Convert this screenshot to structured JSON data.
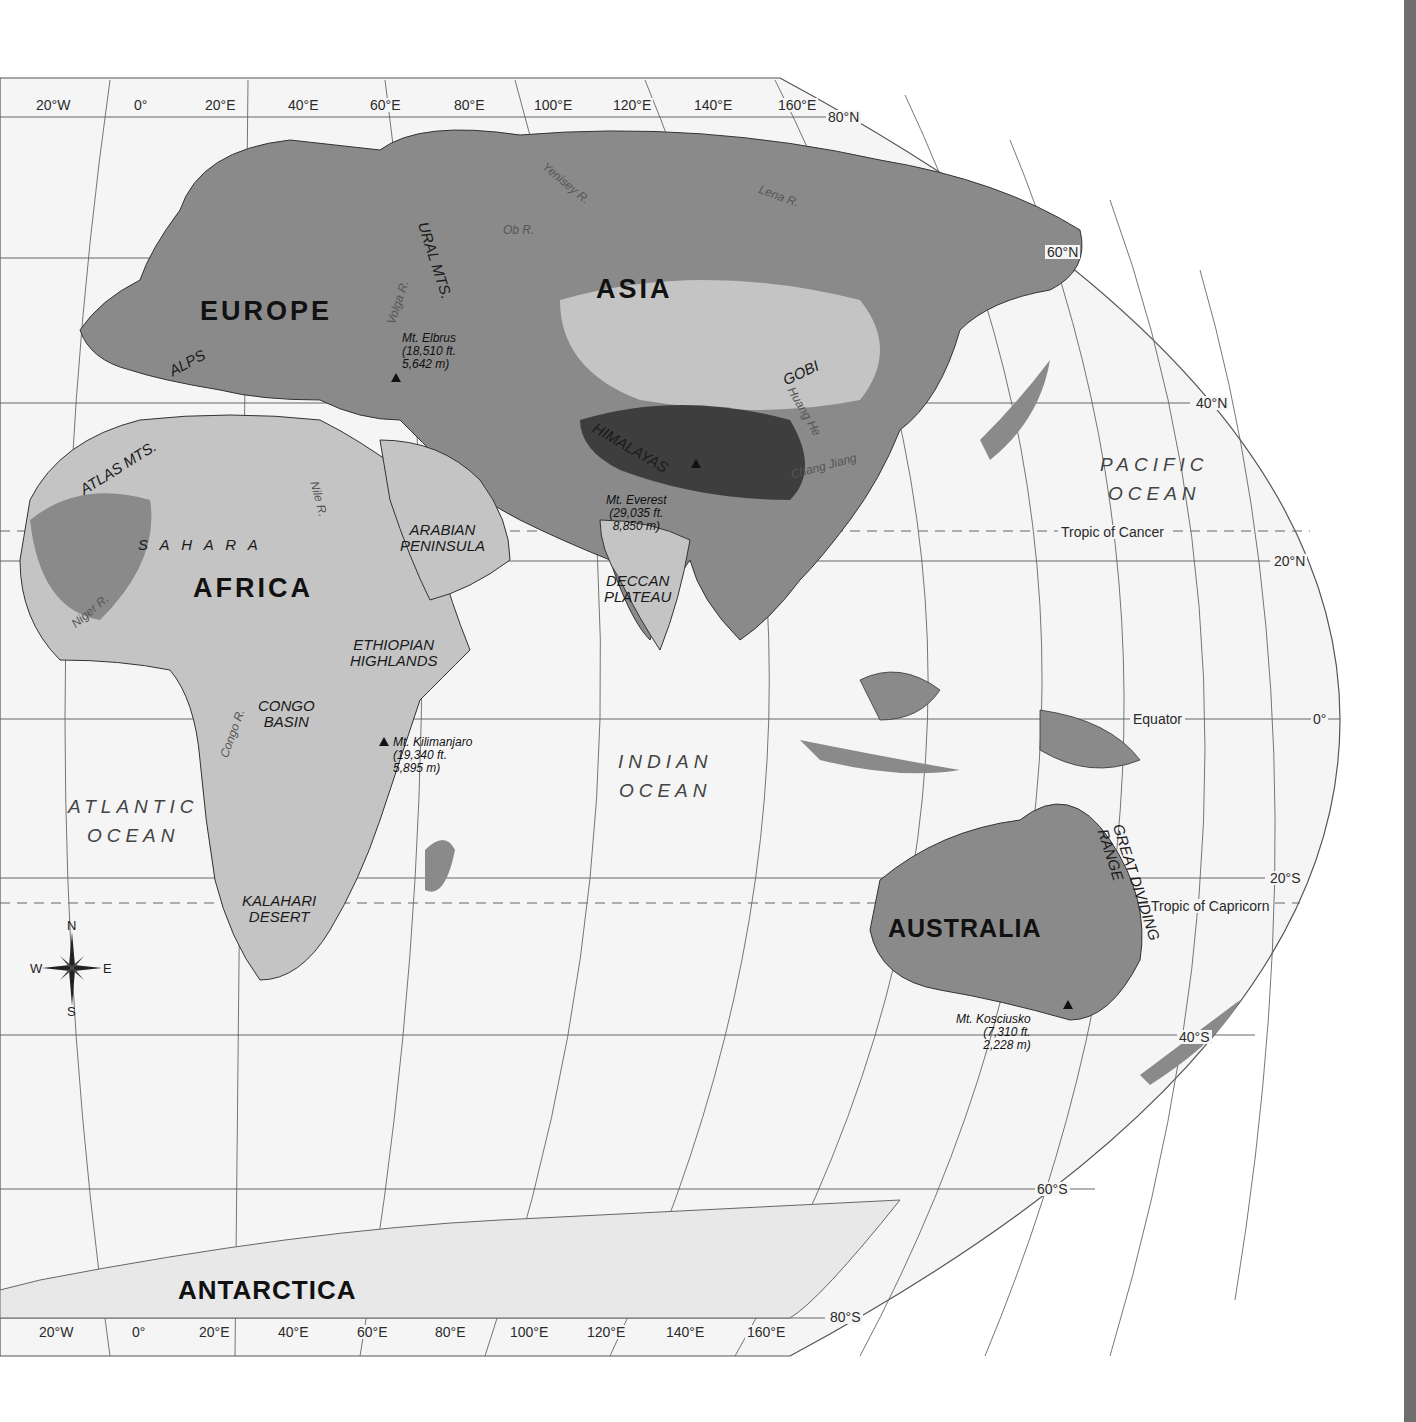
{
  "map": {
    "title": "Eastern Hemisphere Physical Map",
    "colors": {
      "ocean": "#f5f5f5",
      "land_low": "#8a8a8a",
      "land_mid": "#c4c4c4",
      "land_high": "#3e3e3e",
      "grid": "#555555",
      "border": "#111111",
      "spine": "#6e6e6e"
    },
    "longitude_labels_top": [
      "20°W",
      "0°",
      "20°E",
      "40°E",
      "60°E",
      "80°E",
      "100°E",
      "120°E",
      "140°E",
      "160°E"
    ],
    "longitude_labels_bottom": [
      "20°W",
      "0°",
      "20°E",
      "40°E",
      "60°E",
      "80°E",
      "100°E",
      "120°E",
      "140°E",
      "160°E"
    ],
    "latitude_labels": [
      "80°N",
      "60°N",
      "40°N",
      "20°N",
      "0°",
      "20°S",
      "40°S",
      "60°S",
      "80°S"
    ],
    "special_lines": {
      "tropic_cancer": "Tropic of Cancer",
      "equator": "Equator",
      "tropic_capricorn": "Tropic of Capricorn"
    },
    "continents": {
      "europe": "EUROPE",
      "asia": "ASIA",
      "africa": "AFRICA",
      "australia": "AUSTRALIA",
      "antarctica": "ANTARCTICA"
    },
    "oceans": {
      "pacific": [
        "PACIFIC",
        "OCEAN"
      ],
      "atlantic": [
        "ATLANTIC",
        "OCEAN"
      ],
      "indian": [
        "INDIAN",
        "OCEAN"
      ]
    },
    "features": {
      "ural": "URAL MTS.",
      "alps": "ALPS",
      "atlas": "ATLAS MTS.",
      "sahara": "S A H A R A",
      "arabian": [
        "ARABIAN",
        "PENINSULA"
      ],
      "himalayas": "HIMALAYAS",
      "gobi": "GOBI",
      "deccan": [
        "DECCAN",
        "PLATEAU"
      ],
      "ethiopian": [
        "ETHIOPIAN",
        "HIGHLANDS"
      ],
      "congo_basin": [
        "CONGO",
        "BASIN"
      ],
      "kalahari": [
        "KALAHARI",
        "DESERT"
      ],
      "great_dividing": [
        "GREAT DIVIDING",
        "RANGE"
      ]
    },
    "rivers": {
      "yenisey": "Yenisey R.",
      "ob": "Ob R.",
      "lena": "Lena R.",
      "volga": "Volga R.",
      "huang": "Huang He",
      "chang": "Chang Jiang",
      "nile": "Nile R.",
      "niger": "Niger R.",
      "congo": "Congo R."
    },
    "peaks": {
      "elbrus": [
        "Mt. Elbrus",
        "(18,510 ft.",
        "5,642 m)"
      ],
      "everest": [
        "Mt. Everest",
        "(29,035 ft.",
        "8,850 m)"
      ],
      "kilimanjaro": [
        "Mt. Kilimanjaro",
        "(19,340 ft.",
        "5,895 m)"
      ],
      "kosciusko": [
        "Mt. Kosciusko",
        "(7,310 ft.",
        "2,228 m)"
      ]
    },
    "compass": {
      "n": "N",
      "s": "S",
      "e": "E",
      "w": "W"
    }
  }
}
